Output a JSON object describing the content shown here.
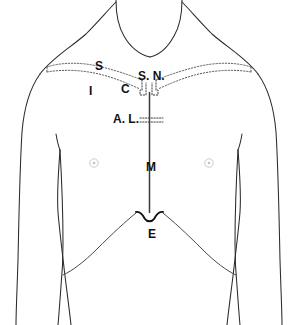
{
  "figure": {
    "width": 298,
    "height": 325,
    "background_color": "#ffffff",
    "line_color": "#2b2b2b"
  },
  "labels": [
    {
      "id": "superior-border-clavicle",
      "text": "S",
      "meaning": "Superior border of clavicle",
      "x": 95,
      "y": 60,
      "size": "label-md"
    },
    {
      "id": "inferior-border-clavicle",
      "text": "I",
      "meaning": "Inferior border of clavicle",
      "x": 89,
      "y": 85,
      "size": "label-md"
    },
    {
      "id": "clavicle",
      "text": "C",
      "meaning": "Clavicle",
      "x": 121,
      "y": 83,
      "size": "label-md"
    },
    {
      "id": "suprasternal-notch",
      "text": "S. N.",
      "meaning": "Suprasternal notch",
      "x": 138,
      "y": 70,
      "size": "label-md"
    },
    {
      "id": "angle-of-louis",
      "text": "A. L.",
      "meaning": "Angle of Louis (sternal angle)",
      "x": 113,
      "y": 113,
      "size": "label-md"
    },
    {
      "id": "manubrium-sternum-body",
      "text": "M",
      "meaning": "Midline / body of sternum",
      "x": 146,
      "y": 161,
      "size": "label-md"
    },
    {
      "id": "epigastric-xiphoid",
      "text": "E",
      "meaning": "Epigastric angle / xiphoid process",
      "x": 148,
      "y": 228,
      "size": "label-md"
    }
  ],
  "markers": {
    "nipple_left": {
      "x": 94,
      "y": 163
    },
    "nipple_right": {
      "x": 209,
      "y": 163
    }
  },
  "colors": {
    "outline": "#2b2b2b",
    "dotted": "#5a5a5a",
    "sternum": "#3a3a3a",
    "nipple": "#c2c2c2",
    "text": "#111111"
  }
}
